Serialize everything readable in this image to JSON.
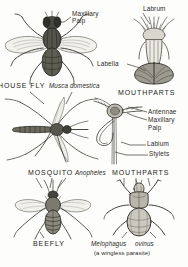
{
  "plate": {
    "title": "Diptera anatomical plate",
    "background_color": "#fdfdfb",
    "ink_color": "#2a2a27"
  },
  "figures": [
    {
      "id": "house-fly",
      "common_name": "HOUSE FLY",
      "species": "Musca domestica",
      "view": "dorsal whole insect",
      "position": "top-left"
    },
    {
      "id": "house-fly-mouthparts",
      "heading": "MOUTHPARTS",
      "view": "proboscis detail",
      "position": "top-right"
    },
    {
      "id": "mosquito",
      "common_name": "MOSQUITO",
      "species": "Anopheles",
      "view": "dorsal whole insect",
      "position": "middle-left"
    },
    {
      "id": "mosquito-mouthparts",
      "heading": "MOUTHPARTS",
      "view": "proboscis detail",
      "position": "middle-right"
    },
    {
      "id": "bee-fly",
      "common_name": "BEEFLY",
      "view": "dorsal whole insect",
      "position": "bottom-left"
    },
    {
      "id": "sheep-ked",
      "species": "Melophagus ovinus",
      "note": "(a wingless parasite)",
      "view": "dorsal whole insect",
      "position": "bottom-right"
    }
  ],
  "labels": {
    "maxillary_palp_fly": "Maxillary\nPalp",
    "labrum": "Labrum",
    "labella": "Labella",
    "house_fly_name": "HOUSE FLY",
    "musca_domestica": "Musca domestica",
    "mouthparts_fly": "MOUTHPARTS",
    "antennae": "Antennae",
    "maxillary_palp_mosq": "Maxillary",
    "maxillary_palp_mosq2": "Palp",
    "labium": "Labium",
    "stylets": "Stylets",
    "mosquito_name": "MOSQUITO",
    "anopheles": "Anopheles",
    "mouthparts_mosquito": "MOUTHPARTS",
    "beefly_name": "BEEFLY",
    "melophagus": "Melophagus",
    "ovinus": "ovinus",
    "wingless_note": "(a wingless parasite)"
  }
}
